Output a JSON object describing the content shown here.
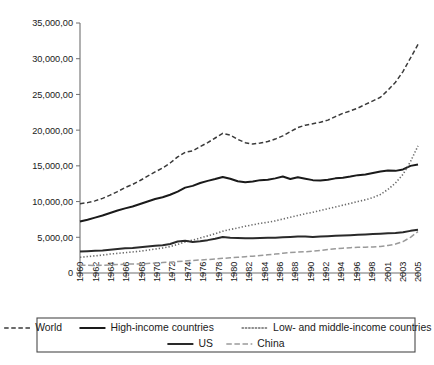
{
  "chart_data": {
    "type": "line",
    "title": "",
    "subtitle": "",
    "xlabel": "",
    "ylabel": "",
    "grid": false,
    "legend_position": "bottom",
    "xlim": [
      1960,
      2005
    ],
    "ylim": [
      0,
      35000
    ],
    "y_ticks": [
      0,
      5000,
      10000,
      15000,
      20000,
      25000,
      30000,
      35000
    ],
    "y_tick_labels": [
      "0",
      "5,000,00",
      "10,000,00",
      "15,000,00",
      "20,000,00",
      "25,000,00",
      "30,000,00",
      "35,000,00"
    ],
    "x_tick_labels": [
      "1960",
      "1962",
      "1964",
      "1966",
      "1968",
      "1970",
      "1972",
      "1974",
      "1976",
      "1978",
      "1980",
      "1982",
      "1984",
      "1986",
      "1988",
      "1990",
      "1992",
      "1994",
      "1996",
      "1998",
      "2001",
      "2003",
      "2005"
    ],
    "x": [
      1960,
      1961,
      1962,
      1963,
      1964,
      1965,
      1966,
      1967,
      1968,
      1969,
      1970,
      1971,
      1972,
      1973,
      1974,
      1975,
      1976,
      1977,
      1978,
      1979,
      1980,
      1981,
      1982,
      1983,
      1984,
      1985,
      1986,
      1987,
      1988,
      1989,
      1990,
      1991,
      1992,
      1993,
      1994,
      1995,
      1996,
      1997,
      1998,
      1999,
      2000,
      2001,
      2002,
      2003,
      2004,
      2005
    ],
    "series": [
      {
        "name": "World",
        "style": "dashed",
        "color": "#3a3a3a",
        "width": 1.5,
        "values": [
          9700,
          9850,
          10100,
          10450,
          10900,
          11400,
          11950,
          12400,
          12950,
          13550,
          14150,
          14700,
          15400,
          16250,
          16900,
          17100,
          17700,
          18250,
          18900,
          19550,
          19300,
          18700,
          18250,
          18050,
          18200,
          18400,
          18750,
          19200,
          19800,
          20350,
          20700,
          20900,
          21100,
          21400,
          21900,
          22350,
          22700,
          23100,
          23600,
          24100,
          24600,
          25600,
          26700,
          28200,
          30100,
          32000
        ]
      },
      {
        "name": "High-income countries",
        "style": "solid",
        "color": "#1a1a1a",
        "width": 2.0,
        "values": [
          7200,
          7450,
          7750,
          8050,
          8400,
          8750,
          9050,
          9300,
          9650,
          10000,
          10350,
          10600,
          10950,
          11400,
          11950,
          12200,
          12600,
          12900,
          13150,
          13450,
          13200,
          12850,
          12700,
          12800,
          13000,
          13050,
          13250,
          13500,
          13150,
          13400,
          13200,
          13000,
          12950,
          13050,
          13250,
          13350,
          13500,
          13700,
          13800,
          14000,
          14200,
          14350,
          14300,
          14500,
          15000,
          15200
        ]
      },
      {
        "name": "Low- and middle-income countries",
        "style": "dotted",
        "color": "#6a6a6a",
        "width": 1.6,
        "values": [
          2200,
          2300,
          2400,
          2500,
          2650,
          2750,
          2850,
          2950,
          3050,
          3200,
          3350,
          3500,
          3700,
          4000,
          4350,
          4600,
          4900,
          5200,
          5500,
          5850,
          6100,
          6300,
          6550,
          6750,
          6950,
          7100,
          7300,
          7550,
          7800,
          8050,
          8300,
          8500,
          8750,
          9000,
          9250,
          9500,
          9750,
          10000,
          10250,
          10550,
          11000,
          11700,
          12600,
          13800,
          15600,
          17800
        ]
      },
      {
        "name": "US",
        "style": "solid",
        "color": "#2a2a2a",
        "width": 2.0,
        "values": [
          3000,
          3050,
          3100,
          3150,
          3250,
          3350,
          3450,
          3500,
          3600,
          3700,
          3800,
          3900,
          4050,
          4400,
          4500,
          4350,
          4450,
          4600,
          4800,
          5050,
          4950,
          4900,
          4850,
          4850,
          4900,
          4950,
          4950,
          5000,
          5050,
          5100,
          5100,
          5050,
          5100,
          5150,
          5200,
          5250,
          5300,
          5350,
          5400,
          5450,
          5500,
          5550,
          5600,
          5700,
          5900,
          6050
        ]
      },
      {
        "name": "China",
        "style": "dashdot",
        "color": "#9a9a9a",
        "width": 1.5,
        "values": [
          1100,
          1080,
          1060,
          1070,
          1120,
          1180,
          1240,
          1260,
          1280,
          1330,
          1400,
          1460,
          1520,
          1600,
          1680,
          1760,
          1820,
          1880,
          1950,
          2050,
          2130,
          2200,
          2280,
          2360,
          2460,
          2560,
          2650,
          2760,
          2860,
          2920,
          2980,
          3060,
          3160,
          3290,
          3400,
          3480,
          3550,
          3600,
          3620,
          3650,
          3720,
          3850,
          4050,
          4400,
          5000,
          5800
        ]
      }
    ]
  },
  "legend": {
    "rows": [
      [
        {
          "label": "World",
          "style": "dashed",
          "color": "#3a3a3a"
        },
        {
          "label": "High-income countries",
          "style": "solid",
          "color": "#1a1a1a"
        },
        {
          "label": "Low- and middle-income countries",
          "style": "dotted",
          "color": "#6a6a6a"
        }
      ],
      [
        {
          "label": "US",
          "style": "solid",
          "color": "#2a2a2a"
        },
        {
          "label": "China",
          "style": "dashdot",
          "color": "#9a9a9a"
        }
      ]
    ]
  }
}
